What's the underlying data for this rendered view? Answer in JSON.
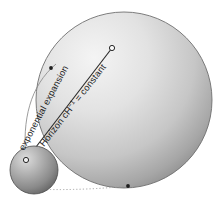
{
  "figure": {
    "background_color": "#ffffff"
  },
  "labels": {
    "exponential_expansion": "exponential expansion",
    "horizon_prefix": "Horizon cH",
    "horizon_exponent": "−1",
    "horizon_suffix": " = constant"
  },
  "shapes": {
    "large_sphere": {
      "name": "expanded-universe-sphere",
      "cx": 124,
      "cy": 100,
      "r": 88,
      "fill_light": "#f2f2f2",
      "fill_mid": "#c9c9c9",
      "fill_dark": "#8e8e8e",
      "stroke": "#6f6f6f"
    },
    "small_sphere": {
      "name": "initial-universe-sphere",
      "cx": 34,
      "cy": 170,
      "r": 24,
      "fill_light": "#d6d6d6",
      "fill_mid": "#9a9a9a",
      "fill_dark": "#5e5e5e",
      "stroke": "#4a4a4a"
    },
    "horizon_line": {
      "name": "horizon-radius-line",
      "x1": 26,
      "y1": 160,
      "x2": 112,
      "y2": 48,
      "stroke": "#2b2b2b"
    },
    "expansion_curve": {
      "name": "exponential-expansion-curve",
      "stroke": "#7a7a7a"
    },
    "baseline": {
      "name": "baseline-dotted-connector",
      "x1": 30,
      "y1": 189,
      "x2": 128,
      "y2": 185,
      "stroke": "#9b9b9b"
    },
    "markers": [
      {
        "name": "marker-origin-point",
        "cx": 26,
        "cy": 160,
        "r": 2.6,
        "type": "open"
      },
      {
        "name": "marker-horizon-endpoint",
        "cx": 112,
        "cy": 48,
        "r": 2.6,
        "type": "open"
      },
      {
        "name": "marker-sphere-edge-point",
        "cx": 51,
        "cy": 68,
        "r": 1.9,
        "type": "filled"
      },
      {
        "name": "marker-sphere-bottom-point",
        "cx": 128,
        "cy": 186,
        "r": 1.9,
        "type": "filled"
      }
    ]
  }
}
